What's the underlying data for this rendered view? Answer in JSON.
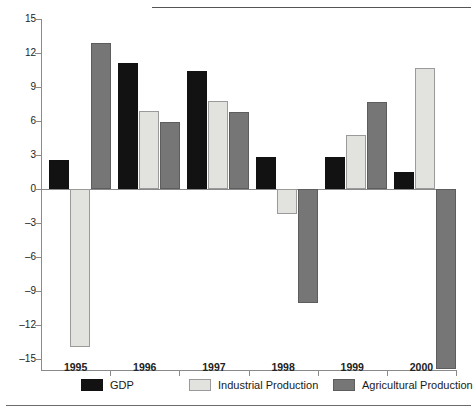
{
  "chart_data": {
    "type": "bar",
    "title": "",
    "subtitle": "",
    "xlabel": "",
    "ylabel": "",
    "categories": [
      "1995",
      "1996",
      "1997",
      "1998",
      "1999",
      "2000"
    ],
    "series": [
      {
        "name": "GDP",
        "color": "#121212",
        "values": [
          2.6,
          11.1,
          10.4,
          2.8,
          2.8,
          1.5
        ]
      },
      {
        "name": "Industrial Production",
        "color": "#e2e2de",
        "values": [
          -13.9,
          6.9,
          7.8,
          -2.2,
          4.8,
          10.7
        ]
      },
      {
        "name": "Agricultural Production",
        "color": "#767676",
        "values": [
          12.9,
          5.9,
          6.8,
          -10.1,
          7.7,
          -15.9
        ]
      }
    ],
    "ylim": [
      -15,
      15
    ],
    "yticks": [
      15,
      12,
      9,
      6,
      3,
      0,
      -3,
      -6,
      -9,
      -12,
      -15
    ],
    "ytick_labels": [
      "15",
      "12",
      "9",
      "6",
      "3",
      "0",
      "–3",
      "–6",
      "–9",
      "–12",
      "–15"
    ],
    "grid": false,
    "legend_position": "bottom"
  },
  "legend": {
    "items": [
      {
        "label": "GDP",
        "swatch": "gdp-swatch"
      },
      {
        "label": "Industrial Production",
        "swatch": "industrial-swatch"
      },
      {
        "label": "Agricultural Production",
        "swatch": "agricultural-swatch"
      }
    ]
  },
  "footer": {
    "cut_text": ""
  }
}
